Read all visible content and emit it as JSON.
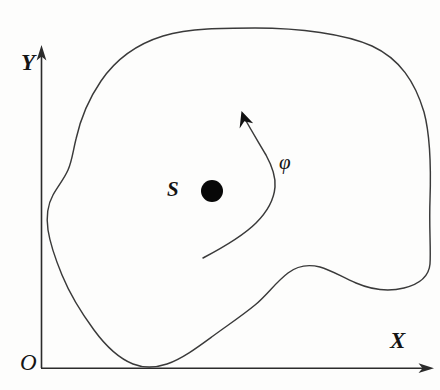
{
  "figure": {
    "background_color": "#fdfdfc",
    "stroke_color": "#3a3a3a",
    "axis_color": "#2b2b2b",
    "marker_color": "#080808",
    "width": 440,
    "height": 390
  },
  "axes": {
    "y_axis": {
      "label": "Y",
      "icon": "up-arrow-axis-icon",
      "origin_px": [
        41,
        368
      ],
      "tip_px": [
        41,
        46
      ]
    },
    "x_axis": {
      "label": "X",
      "icon": "right-arrow-axis-icon",
      "origin_px": [
        41,
        368
      ],
      "tip_px": [
        434,
        368
      ]
    },
    "origin": {
      "label": "O",
      "position_px": [
        27,
        362
      ]
    }
  },
  "annotations": [
    {
      "name": "region-label",
      "label": "S",
      "position_px": [
        176,
        192
      ],
      "description": "Italic capital S naming the closed region"
    },
    {
      "name": "interior-point",
      "label": "",
      "position_px": [
        212,
        191
      ],
      "radius_px": 11,
      "description": "Filled black dot marking an interior point of region S"
    },
    {
      "name": "flux-curve-label",
      "label": "φ",
      "position_px": [
        288,
        165
      ],
      "description": "Italic Greek letter phi labelling the directed curve"
    }
  ],
  "shapes": {
    "region_outline": {
      "name": "closed-region-boundary",
      "closed": true,
      "description": "Smooth closed blob-like boundary of region S with a concave notch on the lower right"
    },
    "directed_curve": {
      "name": "phi-directed-curve",
      "closed": false,
      "arrow_head": true,
      "start_px": [
        203,
        258
      ],
      "end_px": [
        242,
        112
      ],
      "description": "Curved arrow rising from lower middle up and to the left, labelled phi"
    }
  }
}
